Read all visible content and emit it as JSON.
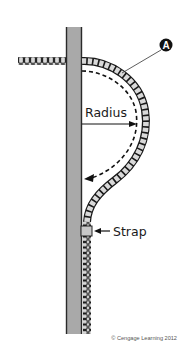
{
  "diagram": {
    "type": "cable-bend-radius-on-pole",
    "labels": {
      "callout": "A",
      "radius": "Radius",
      "strap": "Strap",
      "copyright": "© Cengage Learning 2012"
    },
    "colors": {
      "pole_fill": "#a9a9a9",
      "pole_edge": "#2a2a2a",
      "cable_fill": "#d9d9d9",
      "cable_stroke": "#1a1a1a",
      "callout_fill": "#111111",
      "callout_text": "#ffffff",
      "background": "#ffffff"
    }
  }
}
